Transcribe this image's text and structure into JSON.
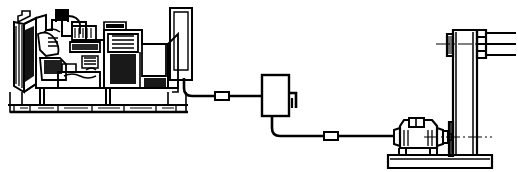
{
  "figure": {
    "type": "technical-line-drawing",
    "style": "monochrome engineering illustration, black line art on white background",
    "canvas": {
      "width": 518,
      "height": 172
    },
    "colors": {
      "line": "#000000",
      "background": "#ffffff",
      "fill_solid": "#000000",
      "fill_void": "#ffffff"
    },
    "labels_present": false,
    "annotations": [],
    "text_content": []
  },
  "components": [
    {
      "id": "generator-set",
      "name": "diesel-generator-set",
      "description": "Skid-mounted diesel engine with coupled alternator, radiator at left end, control panel at right end",
      "bounds": {
        "x": 8,
        "y": 8,
        "width": 190,
        "height": 112
      },
      "subparts": [
        {
          "id": "radiator",
          "name": "radiator-core",
          "bounds": {
            "x": 14,
            "y": 20,
            "width": 22,
            "height": 66
          }
        },
        {
          "id": "engine-block",
          "name": "engine-block",
          "bounds": {
            "x": 36,
            "y": 14,
            "width": 72,
            "height": 78
          }
        },
        {
          "id": "air-cleaner",
          "name": "air-cleaner-stack",
          "bounds": {
            "x": 57,
            "y": 9,
            "width": 10,
            "height": 14
          }
        },
        {
          "id": "alternator",
          "name": "alternator-housing",
          "bounds": {
            "x": 108,
            "y": 28,
            "width": 62,
            "height": 62
          }
        },
        {
          "id": "control-panel",
          "name": "control-panel-cabinet",
          "bounds": {
            "x": 170,
            "y": 8,
            "width": 22,
            "height": 72
          }
        },
        {
          "id": "skid-base",
          "name": "skid-base-frame",
          "bounds": {
            "x": 10,
            "y": 92,
            "width": 176,
            "height": 20
          }
        }
      ]
    },
    {
      "id": "junction-box",
      "name": "junction-box",
      "description": "Rectangular wall-mounted junction / control box with side bracket",
      "bounds": {
        "x": 262,
        "y": 75,
        "width": 27,
        "height": 41
      },
      "subparts": [
        {
          "id": "jb-bracket",
          "name": "junction-box-bracket",
          "bounds": {
            "x": 289,
            "y": 93,
            "width": 9,
            "height": 15
          }
        }
      ]
    },
    {
      "id": "electric-motor",
      "name": "electric-motor",
      "description": "Foot-mounted electric motor with terminal box and output shaft coupling",
      "bounds": {
        "x": 392,
        "y": 118,
        "width": 56,
        "height": 40
      },
      "subparts": [
        {
          "id": "motor-terminal-box",
          "name": "motor-terminal-box",
          "bounds": {
            "x": 408,
            "y": 118,
            "width": 16,
            "height": 9
          }
        },
        {
          "id": "motor-coupling",
          "name": "shaft-coupling",
          "bounds": {
            "x": 440,
            "y": 130,
            "width": 12,
            "height": 14
          }
        },
        {
          "id": "motor-feet",
          "name": "motor-mounting-feet",
          "bounds": {
            "x": 398,
            "y": 148,
            "width": 44,
            "height": 8
          }
        }
      ]
    },
    {
      "id": "pedestal-column",
      "name": "vertical-pedestal-column",
      "description": "Tall vertical column / pillar with top flange bearing and multi-groove pulley sheave",
      "bounds": {
        "x": 451,
        "y": 26,
        "width": 26,
        "height": 132
      },
      "subparts": [
        {
          "id": "column-flange-left",
          "name": "column-bearing-flange",
          "bounds": {
            "x": 446,
            "y": 33,
            "width": 6,
            "height": 22
          }
        },
        {
          "id": "pulley-sheave",
          "name": "multi-groove-pulley",
          "bounds": {
            "x": 477,
            "y": 30,
            "width": 9,
            "height": 28
          }
        },
        {
          "id": "shaft-right",
          "name": "output-shaft",
          "bounds": {
            "x": 486,
            "y": 36,
            "width": 30,
            "height": 16
          }
        },
        {
          "id": "column-shoulder",
          "name": "column-lower-shoulder",
          "bounds": {
            "x": 448,
            "y": 122,
            "width": 5,
            "height": 34
          }
        }
      ]
    },
    {
      "id": "base-plate",
      "name": "common-base-plate",
      "description": "Concrete / steel common base plate supporting motor and pedestal column",
      "bounds": {
        "x": 388,
        "y": 155,
        "width": 104,
        "height": 13
      }
    }
  ],
  "cables": [
    {
      "id": "cable-upper",
      "name": "power-cable-genset-to-junction-box",
      "description": "Cable from generator control panel down and across to junction box, with inline connector",
      "path_points": [
        [
          184,
          78
        ],
        [
          184,
          88
        ],
        [
          192,
          96
        ],
        [
          262,
          96
        ]
      ],
      "connector": {
        "name": "inline-cable-connector",
        "x": 215,
        "y": 92,
        "width": 13,
        "height": 8
      }
    },
    {
      "id": "cable-lower",
      "name": "power-cable-junction-box-to-motor",
      "description": "Cable from junction box down and across to electric motor, with inline connector",
      "path_points": [
        [
          272,
          116
        ],
        [
          272,
          128
        ],
        [
          280,
          136
        ],
        [
          394,
          136
        ]
      ],
      "connector": {
        "name": "inline-cable-connector",
        "x": 324,
        "y": 132,
        "width": 13,
        "height": 8
      }
    }
  ],
  "centerlines": [
    {
      "id": "cl-pulley",
      "name": "pulley-shaft-centerline",
      "y": 44,
      "x1": 436,
      "x2": 516
    },
    {
      "id": "cl-motor",
      "name": "motor-shaft-centerline",
      "y": 137,
      "x1": 424,
      "x2": 492
    }
  ]
}
